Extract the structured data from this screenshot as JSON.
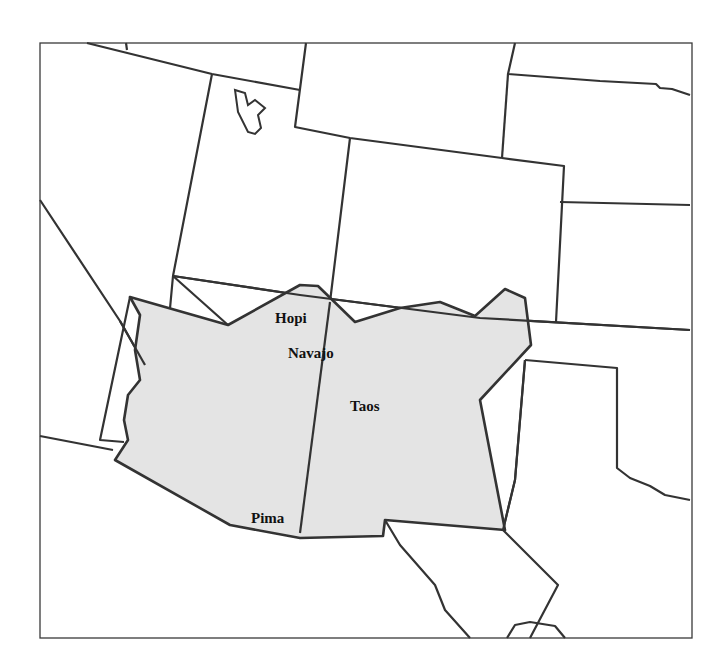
{
  "map": {
    "region_fill": "#e4e4e4",
    "border_color": "#333333",
    "labels": [
      {
        "id": "hopi",
        "text": "Hopi",
        "x": 275,
        "y": 323
      },
      {
        "id": "navajo",
        "text": "Navajo",
        "x": 288,
        "y": 358
      },
      {
        "id": "taos",
        "text": "Taos",
        "x": 350,
        "y": 411
      },
      {
        "id": "pima",
        "text": "Pima",
        "x": 251,
        "y": 523
      }
    ]
  }
}
